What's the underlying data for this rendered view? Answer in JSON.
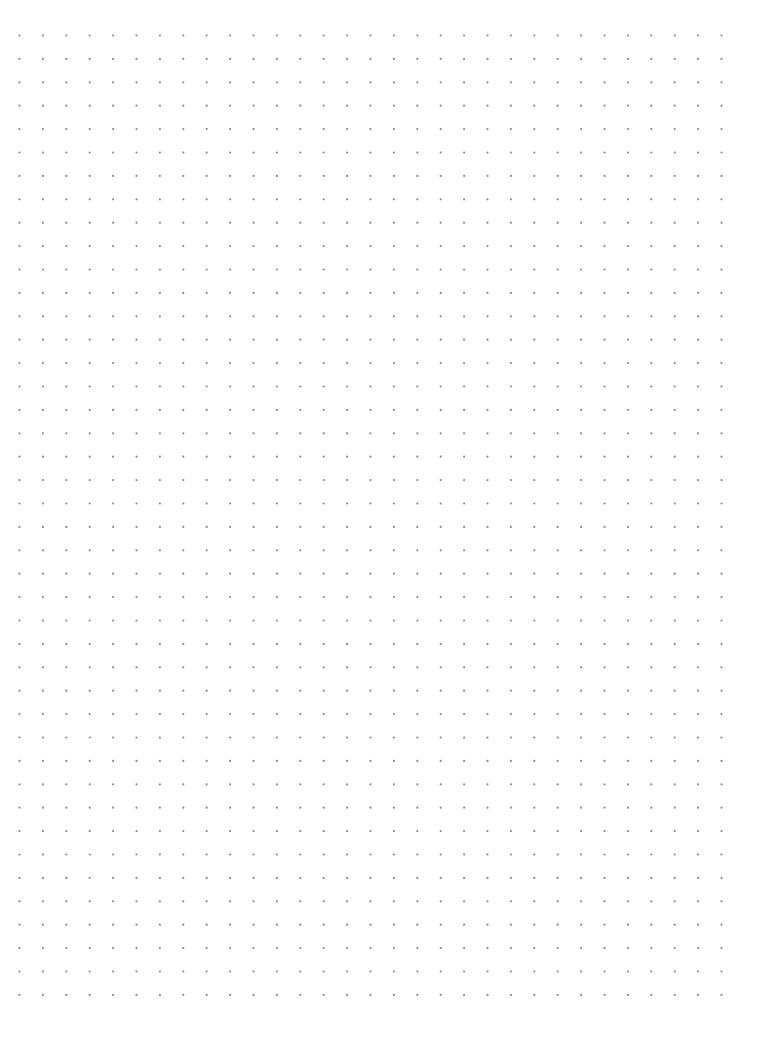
{
  "page": {
    "type": "dot-grid-paper",
    "background_color": "#ffffff",
    "width": 759,
    "height": 1057
  },
  "grid": {
    "columns": 31,
    "rows": 42,
    "origin_x": 19.5,
    "origin_y": 35.5,
    "spacing_x": 23.4,
    "spacing_y": 23.4,
    "dot_radius": 1.1,
    "dot_color": "#8a8a8a"
  }
}
